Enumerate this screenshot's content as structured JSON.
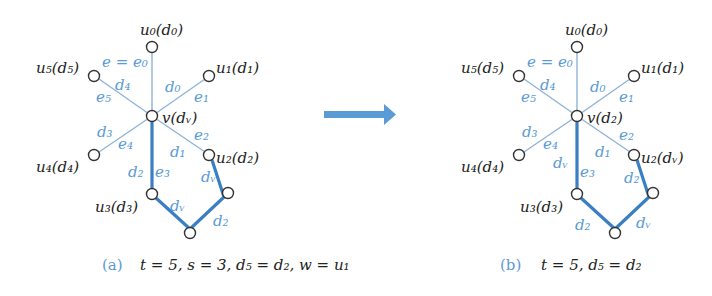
{
  "arrow": {
    "color": "#5b9bd5",
    "direction": "right"
  },
  "colors": {
    "edge_label": "#5b9bd5",
    "thick_edge": "#3a7fc4",
    "thin_edge": "#8fb4d9",
    "text": "#222222"
  },
  "panels": [
    {
      "id": "a",
      "tag": "(a)",
      "caption": "t = 5,  s = 3,  d₅ = d₂,  w = u₁",
      "center": {
        "name": "v",
        "color": "d_v",
        "label": "v(dᵥ)"
      },
      "neighbors": [
        {
          "name": "u0",
          "label": "u₀(d₀)"
        },
        {
          "name": "u1",
          "label": "u₁(d₁)"
        },
        {
          "name": "u2",
          "label": "u₂(d₂)"
        },
        {
          "name": "u3",
          "label": "u₃(d₃)"
        },
        {
          "name": "u4",
          "label": "u₄(d₄)"
        },
        {
          "name": "u5",
          "label": "u₅(d₅)"
        }
      ],
      "edge_labels": {
        "e0": "e = e₀",
        "e1": "e₁",
        "e2": "e₂",
        "e3": "e₃",
        "e4": "e₄",
        "e5": "e₅",
        "c_e1": "d₀",
        "c_e2": "d₁",
        "c_e3": "d₂",
        "c_e4": "d₃",
        "c_e5": "d₄",
        "path_u2_r": "dᵥ",
        "path_r_b": "d₂",
        "path_u3_b": "dᵥ"
      }
    },
    {
      "id": "b",
      "tag": "(b)",
      "caption": "t = 5,  d₅ = d₂",
      "center": {
        "name": "v",
        "color": "d_2",
        "label": "v(d₂)"
      },
      "neighbors": [
        {
          "name": "u0",
          "label": "u₀(d₀)"
        },
        {
          "name": "u1",
          "label": "u₁(d₁)"
        },
        {
          "name": "u2",
          "label": "u₂(dᵥ)"
        },
        {
          "name": "u3",
          "label": "u₃(d₃)"
        },
        {
          "name": "u4",
          "label": "u₄(d₄)"
        },
        {
          "name": "u5",
          "label": "u₅(d₅)"
        }
      ],
      "edge_labels": {
        "e0": "e = e₀",
        "e1": "e₁",
        "e2": "e₂",
        "e3": "e₃",
        "e4": "e₄",
        "e5": "e₅",
        "c_e1": "d₀",
        "c_e2": "d₁",
        "c_e3": "dᵥ",
        "c_e4": "d₃",
        "c_e5": "d₄",
        "path_u2_r": "d₂",
        "path_r_b": "dᵥ",
        "path_u3_b": "d₂"
      }
    }
  ]
}
